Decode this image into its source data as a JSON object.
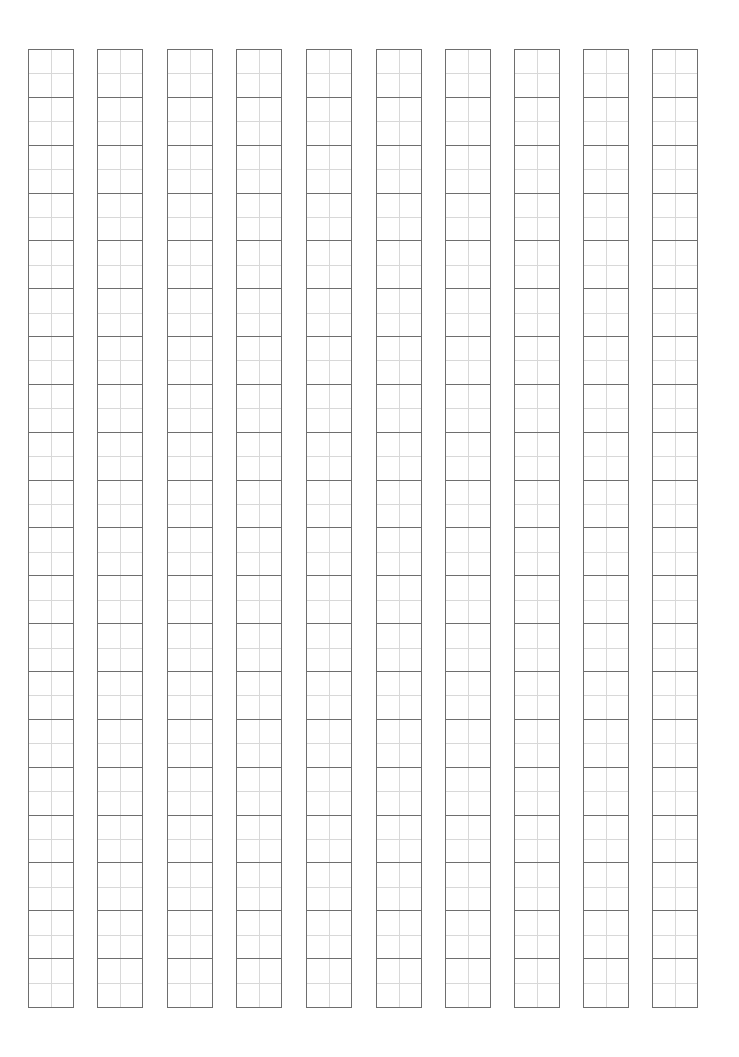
{
  "sheet": {
    "type": "tian-zi-ge practice grid",
    "columns": 10,
    "rows_per_column": 20,
    "column_x": [
      28,
      97,
      167,
      236,
      306,
      376,
      445,
      514,
      583,
      652
    ],
    "grid_top": 49,
    "grid_height": 959,
    "column_width": 46,
    "colors": {
      "border": "#6e6e6e",
      "guide": "#d8d8d8",
      "background": "#ffffff"
    }
  }
}
